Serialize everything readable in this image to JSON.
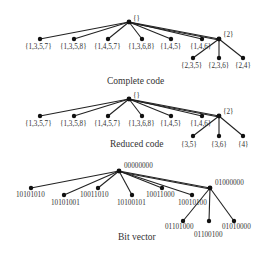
{
  "diagrams": [
    {
      "caption": "Complete code",
      "root": "{}",
      "children": [
        "{1,3,5,7}",
        "{1,3,5,8}",
        "{1,4,5,7}",
        "{1,3,6,8}",
        "{1,4,5}",
        "{1,4,6}",
        "{2}"
      ],
      "sub_children": [
        "{2,3,5}",
        "{2,3,6}",
        "{2,4}"
      ]
    },
    {
      "caption": "Reduced code",
      "root": "{}",
      "children": [
        "{1,3,5,7}",
        "{1,3,5,8}",
        "{1,4,5,7}",
        "{1,3,6,8}",
        "{1,4,5}",
        "{1,4,6}",
        "{2}"
      ],
      "sub_children": [
        "{3,5}",
        "{3,6}",
        "{4}"
      ]
    },
    {
      "caption": "Bit vector",
      "root": "00000000",
      "children": [
        "10101010",
        "10101001",
        "10011010",
        "10100101",
        "10011000",
        "10010100",
        "01000000"
      ],
      "sub_children": [
        "01101000",
        "01100100",
        "01010000"
      ]
    }
  ]
}
